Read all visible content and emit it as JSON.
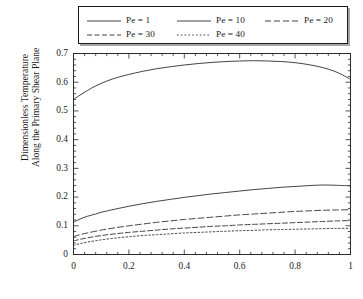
{
  "chart_data": {
    "type": "line",
    "title": "",
    "xlabel": "",
    "ylabel": "Dimensionless Temperature Along the Primary Shear Plane",
    "ylabel_line1": "Dimensionless Temperature",
    "ylabel_line2": "Along the Primary Shear Plane",
    "xlim": [
      0,
      1
    ],
    "ylim": [
      0,
      0.7
    ],
    "xticks": [
      0,
      0.2,
      0.4,
      0.6,
      0.8,
      1
    ],
    "xtick_labels": [
      "0",
      "0.2",
      "0.4",
      "0.6",
      "0.8",
      "1"
    ],
    "yticks": [
      0,
      0.1,
      0.2,
      0.3,
      0.4,
      0.5,
      0.6,
      0.7
    ],
    "ytick_labels": [
      "0",
      "0.1",
      "0.2",
      "0.3",
      "0.4",
      "0.5",
      "0.6",
      "0.7"
    ],
    "x_minor_ticks_per_major": 4,
    "y_minor_ticks_per_major": 4,
    "grid": false,
    "legend_position": "above-plot",
    "line_color": "#3a3a3a",
    "series": [
      {
        "name": "Pe = 1",
        "label": "Pe = 1",
        "dash": "solid",
        "x": [
          0,
          0.02,
          0.05,
          0.08,
          0.12,
          0.16,
          0.2,
          0.25,
          0.3,
          0.35,
          0.4,
          0.45,
          0.5,
          0.55,
          0.6,
          0.65,
          0.7,
          0.75,
          0.8,
          0.85,
          0.9,
          0.94,
          0.97,
          1
        ],
        "values": [
          0.54,
          0.553,
          0.571,
          0.587,
          0.604,
          0.617,
          0.627,
          0.638,
          0.647,
          0.654,
          0.66,
          0.665,
          0.669,
          0.672,
          0.674,
          0.675,
          0.674,
          0.672,
          0.668,
          0.661,
          0.651,
          0.639,
          0.626,
          0.61
        ]
      },
      {
        "name": "Pe = 10",
        "label": "Pe = 10",
        "dash": "solid",
        "x": [
          0,
          0.02,
          0.05,
          0.08,
          0.1,
          0.15,
          0.2,
          0.25,
          0.3,
          0.35,
          0.4,
          0.45,
          0.5,
          0.55,
          0.6,
          0.65,
          0.7,
          0.75,
          0.8,
          0.85,
          0.9,
          0.95,
          1
        ],
        "values": [
          0.112,
          0.122,
          0.133,
          0.141,
          0.147,
          0.158,
          0.168,
          0.177,
          0.185,
          0.192,
          0.199,
          0.205,
          0.211,
          0.216,
          0.221,
          0.226,
          0.23,
          0.234,
          0.237,
          0.24,
          0.242,
          0.241,
          0.239
        ]
      },
      {
        "name": "Pe = 20",
        "label": "Pe = 20",
        "dash": "dashed",
        "x": [
          0,
          0.02,
          0.05,
          0.1,
          0.15,
          0.2,
          0.25,
          0.3,
          0.35,
          0.4,
          0.45,
          0.5,
          0.55,
          0.6,
          0.65,
          0.7,
          0.75,
          0.8,
          0.85,
          0.9,
          0.95,
          1
        ],
        "values": [
          0.062,
          0.068,
          0.075,
          0.085,
          0.093,
          0.1,
          0.106,
          0.112,
          0.117,
          0.122,
          0.126,
          0.13,
          0.134,
          0.138,
          0.141,
          0.144,
          0.147,
          0.15,
          0.152,
          0.154,
          0.155,
          0.156
        ]
      },
      {
        "name": "Pe = 30",
        "label": "Pe = 30",
        "dash": "dash-dot",
        "x": [
          0,
          0.02,
          0.05,
          0.1,
          0.15,
          0.2,
          0.25,
          0.3,
          0.35,
          0.4,
          0.45,
          0.5,
          0.55,
          0.6,
          0.65,
          0.7,
          0.75,
          0.8,
          0.85,
          0.9,
          0.95,
          1
        ],
        "values": [
          0.047,
          0.052,
          0.058,
          0.066,
          0.072,
          0.077,
          0.081,
          0.085,
          0.089,
          0.092,
          0.095,
          0.098,
          0.1,
          0.103,
          0.105,
          0.107,
          0.109,
          0.111,
          0.113,
          0.115,
          0.117,
          0.118
        ]
      },
      {
        "name": "Pe = 40",
        "label": "Pe = 40",
        "dash": "dotted",
        "x": [
          0,
          0.02,
          0.05,
          0.1,
          0.15,
          0.2,
          0.25,
          0.3,
          0.35,
          0.4,
          0.45,
          0.5,
          0.55,
          0.6,
          0.65,
          0.7,
          0.75,
          0.8,
          0.85,
          0.9,
          0.95,
          1
        ],
        "values": [
          0.032,
          0.037,
          0.043,
          0.051,
          0.057,
          0.062,
          0.066,
          0.069,
          0.072,
          0.075,
          0.077,
          0.079,
          0.081,
          0.083,
          0.084,
          0.086,
          0.087,
          0.088,
          0.089,
          0.09,
          0.091,
          0.091
        ]
      }
    ]
  },
  "legend": {
    "entries": [
      {
        "label": "Pe = 1"
      },
      {
        "label": "Pe = 10"
      },
      {
        "label": "Pe = 20"
      },
      {
        "label": "Pe = 30"
      },
      {
        "label": "Pe = 40"
      }
    ]
  },
  "footer": {
    "caption": ""
  }
}
